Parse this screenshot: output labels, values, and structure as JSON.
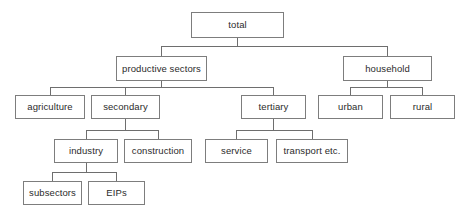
{
  "diagram": {
    "type": "hierarchy-tree",
    "colors": {
      "box_border": "#7d7d7d",
      "connector": "#6e6e6e",
      "text": "#2b2b2b",
      "background": "#ffffff"
    },
    "nodes": {
      "total": {
        "label": "total",
        "level": 0
      },
      "productive_sectors": {
        "label": "productive sectors",
        "level": 1
      },
      "household": {
        "label": "household",
        "level": 1
      },
      "agriculture": {
        "label": "agriculture",
        "level": 2
      },
      "secondary": {
        "label": "secondary",
        "level": 2
      },
      "tertiary": {
        "label": "tertiary",
        "level": 2
      },
      "urban": {
        "label": "urban",
        "level": 2
      },
      "rural": {
        "label": "rural",
        "level": 2
      },
      "industry": {
        "label": "industry",
        "level": 3
      },
      "construction": {
        "label": "construction",
        "level": 3
      },
      "service": {
        "label": "service",
        "level": 3
      },
      "transport": {
        "label": "transport etc.",
        "level": 3
      },
      "subsectors": {
        "label": "subsectors",
        "level": 4
      },
      "eips": {
        "label": "EIPs",
        "level": 4
      }
    },
    "edges": [
      {
        "from": "total",
        "to": "productive sectors"
      },
      {
        "from": "total",
        "to": "household"
      },
      {
        "from": "productive sectors",
        "to": "agriculture"
      },
      {
        "from": "productive sectors",
        "to": "secondary"
      },
      {
        "from": "productive sectors",
        "to": "tertiary"
      },
      {
        "from": "household",
        "to": "urban"
      },
      {
        "from": "household",
        "to": "rural"
      },
      {
        "from": "secondary",
        "to": "industry"
      },
      {
        "from": "secondary",
        "to": "construction"
      },
      {
        "from": "tertiary",
        "to": "service"
      },
      {
        "from": "tertiary",
        "to": "transport etc."
      },
      {
        "from": "industry",
        "to": "subsectors"
      },
      {
        "from": "industry",
        "to": "EIPs"
      }
    ]
  }
}
